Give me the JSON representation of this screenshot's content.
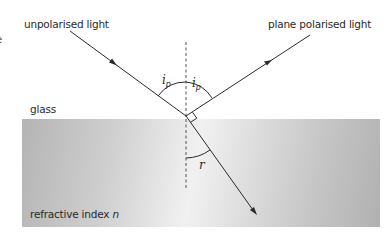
{
  "diagram": {
    "labels": {
      "unpolarised": "unpolarised light",
      "plane_polarised": "plane polarised light",
      "medium": "glass",
      "refractive_index_prefix": "refractive index",
      "refractive_index_symbol": "n",
      "edge_glyph": "e"
    },
    "angles": {
      "incidence_symbol": "i",
      "incidence_subscript": "p",
      "reflection_symbol": "i",
      "reflection_subscript": "p",
      "refraction_symbol": "r"
    },
    "elements": {
      "incident_ray": "incident ray (unpolarised)",
      "reflected_ray": "reflected ray (plane polarised)",
      "refracted_ray": "refracted ray",
      "normal": "dashed normal line",
      "right_angle": "90° between reflected and refracted rays"
    },
    "colors": {
      "ray": "#2a2a2a",
      "glass_dark": "#b4b4b4",
      "glass_light": "#f1f1f1",
      "text": "#2a2a2a"
    }
  }
}
